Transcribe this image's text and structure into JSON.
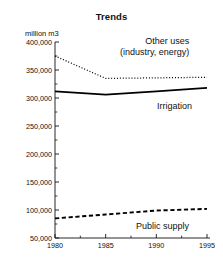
{
  "chart_data": {
    "type": "line",
    "title": "Trends",
    "xlabel": "",
    "ylabel": "million m3",
    "x": [
      1980,
      1985,
      1990,
      1995
    ],
    "xtick_labels": [
      "1980",
      "1985",
      "1990",
      "1995"
    ],
    "xlim": [
      1980,
      1995
    ],
    "ylim": [
      50000,
      400000
    ],
    "ytick_labels": [
      "400,000",
      "350,000",
      "300,000",
      "250,000",
      "200,000",
      "150,000",
      "100,000",
      "50,000"
    ],
    "ytick_values": [
      400000,
      350000,
      300000,
      250000,
      200000,
      150000,
      100000,
      50000
    ],
    "minor_tick_step": 25000,
    "grid": false,
    "legend": "inline-annotations",
    "series": [
      {
        "name": "Other uses (industry, energy)",
        "style": "dotted",
        "values": [
          375000,
          335000,
          336000,
          337000
        ]
      },
      {
        "name": "Irrigation",
        "style": "solid",
        "values": [
          312000,
          306000,
          312000,
          318000
        ]
      },
      {
        "name": "Public supply",
        "style": "dashed",
        "values": [
          85000,
          92000,
          99000,
          102000
        ]
      }
    ],
    "annotations": [
      {
        "id": "other_uses",
        "line1": "Other uses",
        "line2": "(industry, energy)"
      },
      {
        "id": "irrigation",
        "text": "Irrigation"
      },
      {
        "id": "public_supply",
        "text": "Public supply"
      }
    ],
    "colors": {
      "axis": "#111111",
      "series_line": "#000000",
      "background": "#ffffff",
      "text": "#111111"
    }
  }
}
